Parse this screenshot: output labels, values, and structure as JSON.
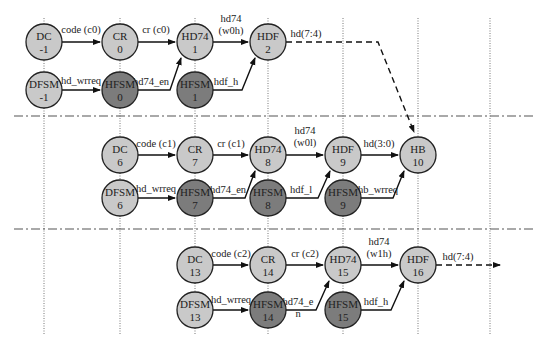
{
  "colors": {
    "light_node": "#c9c9c9",
    "dark_node": "#7c7c7c",
    "stroke": "#222222",
    "background": "#ffffff"
  },
  "vertical_lines_x": [
    44,
    120,
    195,
    268,
    343,
    418,
    490
  ],
  "separators_y": [
    116,
    229
  ],
  "nodes": [
    {
      "id": "dc-m1",
      "name": "DC",
      "num": "-1",
      "x": 44,
      "y": 42,
      "shade": "light"
    },
    {
      "id": "cr-0",
      "name": "CR",
      "num": "0",
      "x": 120,
      "y": 42,
      "shade": "light"
    },
    {
      "id": "hd74-1",
      "name": "HD74",
      "num": "1",
      "x": 195,
      "y": 42,
      "shade": "light"
    },
    {
      "id": "hdf-2",
      "name": "HDF",
      "num": "2",
      "x": 268,
      "y": 42,
      "shade": "light"
    },
    {
      "id": "dfsm-m1",
      "name": "DFSM",
      "num": "-1",
      "x": 44,
      "y": 90,
      "shade": "light"
    },
    {
      "id": "hfsm-0",
      "name": "HFSM",
      "num": "0",
      "x": 120,
      "y": 90,
      "shade": "dark"
    },
    {
      "id": "hfsm-1",
      "name": "HFSM",
      "num": "1",
      "x": 195,
      "y": 90,
      "shade": "dark"
    },
    {
      "id": "dc-6",
      "name": "DC",
      "num": "6",
      "x": 120,
      "y": 155,
      "shade": "light"
    },
    {
      "id": "cr-7",
      "name": "CR",
      "num": "7",
      "x": 195,
      "y": 155,
      "shade": "light"
    },
    {
      "id": "hd74-8",
      "name": "HD74",
      "num": "8",
      "x": 268,
      "y": 155,
      "shade": "light"
    },
    {
      "id": "hdf-9",
      "name": "HDF",
      "num": "9",
      "x": 343,
      "y": 155,
      "shade": "light"
    },
    {
      "id": "hb-10",
      "name": "HB",
      "num": "10",
      "x": 418,
      "y": 155,
      "shade": "light"
    },
    {
      "id": "dfsm-6",
      "name": "DFSM",
      "num": "6",
      "x": 120,
      "y": 198,
      "shade": "light"
    },
    {
      "id": "hfsm-7",
      "name": "HFSM",
      "num": "7",
      "x": 195,
      "y": 198,
      "shade": "dark"
    },
    {
      "id": "hfsm-8",
      "name": "HFSM",
      "num": "8",
      "x": 268,
      "y": 198,
      "shade": "dark"
    },
    {
      "id": "hfsm-9",
      "name": "HFSM",
      "num": "9",
      "x": 343,
      "y": 198,
      "shade": "dark"
    },
    {
      "id": "dc-13",
      "name": "DC",
      "num": "13",
      "x": 195,
      "y": 265,
      "shade": "light"
    },
    {
      "id": "cr-14",
      "name": "CR",
      "num": "14",
      "x": 268,
      "y": 265,
      "shade": "light"
    },
    {
      "id": "hd74-15",
      "name": "HD74",
      "num": "15",
      "x": 343,
      "y": 265,
      "shade": "light"
    },
    {
      "id": "hdf-16",
      "name": "HDF",
      "num": "16",
      "x": 418,
      "y": 265,
      "shade": "light"
    },
    {
      "id": "dfsm-13",
      "name": "DFSM",
      "num": "13",
      "x": 195,
      "y": 310,
      "shade": "light"
    },
    {
      "id": "hfsm-14",
      "name": "HFSM",
      "num": "14",
      "x": 268,
      "y": 310,
      "shade": "dark"
    },
    {
      "id": "hfsm-15",
      "name": "HFSM",
      "num": "15",
      "x": 343,
      "y": 310,
      "shade": "dark"
    }
  ],
  "edges": [
    {
      "id": "e1",
      "label": [
        "code (c0)"
      ],
      "path": "M62,42 L100,42",
      "lx": 81,
      "ly": 33
    },
    {
      "id": "e2",
      "label": [
        "cr (c0)"
      ],
      "path": "M138,42 L175,42",
      "lx": 156,
      "ly": 33
    },
    {
      "id": "e3",
      "label": [
        "hd74",
        "(w0h)"
      ],
      "path": "M213,42 L248,42",
      "lx": 231,
      "ly": 22
    },
    {
      "id": "e4",
      "label": [
        "hd(7:4)"
      ],
      "path": "M286,42 L378,42 L414,132",
      "lx": 306,
      "ly": 37,
      "dashed": true
    },
    {
      "id": "e5",
      "label": [
        "hd_wrreq"
      ],
      "path": "M62,90 L100,90",
      "lx": 81,
      "ly": 84
    },
    {
      "id": "e6",
      "label": [
        "hd74_en"
      ],
      "path": "M138,90 L170,90 L181,58",
      "lx": 151,
      "ly": 85
    },
    {
      "id": "e7",
      "label": [
        "hdf_h"
      ],
      "path": "M213,90 L242,90 L255,58",
      "lx": 226,
      "ly": 85
    },
    {
      "id": "e8",
      "label": [
        "code (c1)"
      ],
      "path": "M138,155 L175,155",
      "lx": 156,
      "ly": 147
    },
    {
      "id": "e9",
      "label": [
        "cr (c1)"
      ],
      "path": "M213,155 L248,155",
      "lx": 231,
      "ly": 147
    },
    {
      "id": "e10",
      "label": [
        "hd74",
        "(w0l)"
      ],
      "path": "M286,155 L323,155",
      "lx": 305,
      "ly": 134
    },
    {
      "id": "e11",
      "label": [
        "hd(3:0)"
      ],
      "path": "M361,155 L398,155",
      "lx": 379,
      "ly": 147
    },
    {
      "id": "e12",
      "label": [
        "hd_wrreq"
      ],
      "path": "M138,198 L175,198",
      "lx": 156,
      "ly": 192
    },
    {
      "id": "e13",
      "label": [
        "hd74_en"
      ],
      "path": "M213,198 L245,198 L255,171",
      "lx": 228,
      "ly": 193
    },
    {
      "id": "e14",
      "label": [
        "hdf_l"
      ],
      "path": "M286,198 L318,198 L330,171",
      "lx": 301,
      "ly": 193
    },
    {
      "id": "e15",
      "label": [
        "hb_wrreq"
      ],
      "path": "M361,198 L393,198 L404,171",
      "lx": 378,
      "ly": 193
    },
    {
      "id": "e16",
      "label": [
        "code (c2)"
      ],
      "path": "M213,265 L248,265",
      "lx": 231,
      "ly": 257
    },
    {
      "id": "e17",
      "label": [
        "cr (c2)"
      ],
      "path": "M286,265 L323,265",
      "lx": 305,
      "ly": 257
    },
    {
      "id": "e18",
      "label": [
        "hd74",
        "(w1h)"
      ],
      "path": "M361,265 L398,265",
      "lx": 379,
      "ly": 245
    },
    {
      "id": "e19",
      "label": [
        "hd(7:4)"
      ],
      "path": "M436,265 L500,265",
      "lx": 458,
      "ly": 260,
      "dashed": true
    },
    {
      "id": "e20",
      "label": [
        "hd74_e",
        "n"
      ],
      "path": "M286,310 L316,310 L329,281",
      "lx": 298,
      "ly": 305
    },
    {
      "id": "e21",
      "label": [
        "hd_wrreq"
      ],
      "path": "M213,310 L248,310",
      "lx": 231,
      "ly": 303
    },
    {
      "id": "e22",
      "label": [
        "hdf_h"
      ],
      "path": "M361,310 L391,310 L404,281",
      "lx": 376,
      "ly": 305
    }
  ]
}
